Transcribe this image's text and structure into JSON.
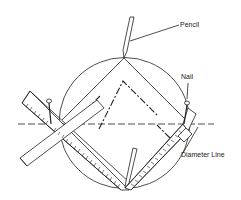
{
  "diagram": {
    "labels": {
      "pencil": "Pencil",
      "nail": "Nail",
      "diameter_line": "Diameter Line"
    },
    "colors": {
      "ink": "#222222",
      "background": "#ffffff"
    }
  }
}
